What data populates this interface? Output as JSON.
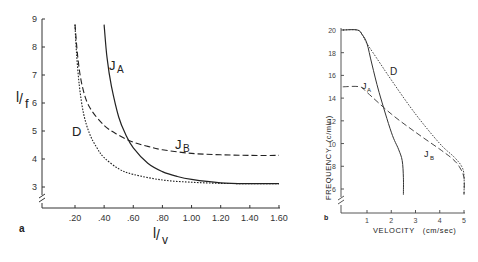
{
  "chart_data": [
    {
      "panel": "a",
      "type": "line",
      "xlabel": "1/v",
      "ylabel": "1/f",
      "xlim": [
        0,
        1.6
      ],
      "ylim": [
        2.5,
        9
      ],
      "x_ticks": [
        ".20",
        ".40",
        ".60",
        ".80",
        "1.00",
        "1.20",
        "1.40",
        "1.60"
      ],
      "y_ticks": [
        "3",
        "4",
        "5",
        "6",
        "7",
        "8",
        "9"
      ],
      "axis_break": "y",
      "grid": false,
      "series": [
        {
          "name": "JA",
          "style": "solid",
          "x": [
            0.4,
            0.42,
            0.45,
            0.5,
            0.55,
            0.6,
            0.7,
            0.8,
            0.9,
            1.0,
            1.2,
            1.4,
            1.6
          ],
          "y": [
            8.8,
            7.6,
            6.6,
            5.5,
            4.85,
            4.4,
            3.85,
            3.55,
            3.38,
            3.27,
            3.15,
            3.12,
            3.12
          ]
        },
        {
          "name": "JB",
          "style": "dashed",
          "x": [
            0.2,
            0.22,
            0.25,
            0.3,
            0.4,
            0.5,
            0.6,
            0.7,
            0.8,
            1.0,
            1.2,
            1.4,
            1.6
          ],
          "y": [
            8.8,
            7.6,
            6.6,
            5.85,
            5.2,
            4.85,
            4.6,
            4.45,
            4.33,
            4.2,
            4.15,
            4.13,
            4.13
          ]
        },
        {
          "name": "D",
          "style": "dotted",
          "x": [
            0.2,
            0.21,
            0.23,
            0.26,
            0.3,
            0.35,
            0.4,
            0.5,
            0.6,
            0.8,
            1.0,
            1.2,
            1.4,
            1.6
          ],
          "y": [
            8.8,
            7.8,
            6.6,
            5.6,
            4.9,
            4.4,
            4.05,
            3.65,
            3.45,
            3.25,
            3.17,
            3.13,
            3.12,
            3.12
          ]
        }
      ],
      "annotations": [
        "JA",
        "JB",
        "D"
      ],
      "panel_label": "a"
    },
    {
      "panel": "b",
      "type": "line",
      "xlabel": "VELOCITY (cm/sec)",
      "ylabel": "FREQUENCY (c/min)",
      "xlim": [
        0,
        5
      ],
      "ylim": [
        5,
        20
      ],
      "x_ticks": [
        "1",
        "2",
        "3",
        "4",
        "5"
      ],
      "y_ticks": [
        "6",
        "8",
        "10",
        "12",
        "14",
        "16",
        "18",
        "20"
      ],
      "axis_break": "y",
      "grid": false,
      "series": [
        {
          "name": "JA",
          "style": "solid",
          "x": [
            0,
            0.6,
            0.8,
            1.0,
            1.2,
            1.5,
            2.0,
            2.3,
            2.45,
            2.5,
            2.5
          ],
          "y": [
            20,
            20,
            19.6,
            18.8,
            17.0,
            14.5,
            11.0,
            9.5,
            8.5,
            7.0,
            5.5
          ]
        },
        {
          "name": "JB",
          "style": "dashed",
          "x": [
            0,
            0.7,
            1.0,
            2.0,
            3.0,
            4.0,
            4.5,
            4.8,
            5.0,
            5.0
          ],
          "y": [
            15,
            15,
            14.5,
            12.6,
            11.0,
            9.5,
            8.7,
            8.0,
            7.0,
            5.5
          ]
        },
        {
          "name": "D",
          "style": "dotted",
          "x": [
            0,
            0.6,
            0.8,
            1.0,
            1.5,
            2.0,
            3.0,
            4.0,
            4.6,
            4.9,
            5.0,
            5.0
          ],
          "y": [
            20,
            20,
            19.6,
            18.8,
            17.2,
            15.6,
            12.6,
            10.0,
            8.8,
            8.0,
            7.2,
            5.5
          ]
        }
      ],
      "annotations": [
        "JA",
        "JB",
        "D"
      ],
      "panel_label": "b"
    }
  ],
  "panel_a": {
    "label": "a",
    "y_label_main": "1/f",
    "x_label_main": "1/v",
    "curve_labels": {
      "JA": "J",
      "JA_sub": "A",
      "JB": "J",
      "JB_sub": "B",
      "D": "D"
    }
  },
  "panel_b": {
    "label": "b",
    "y_label": "FREQUENCY  (c/min)",
    "x_label": "VELOCITY   (cm/sec)",
    "curve_labels": {
      "JA": "J",
      "JA_sub": "A",
      "JB": "J",
      "JB_sub": "B",
      "D": "D"
    }
  }
}
